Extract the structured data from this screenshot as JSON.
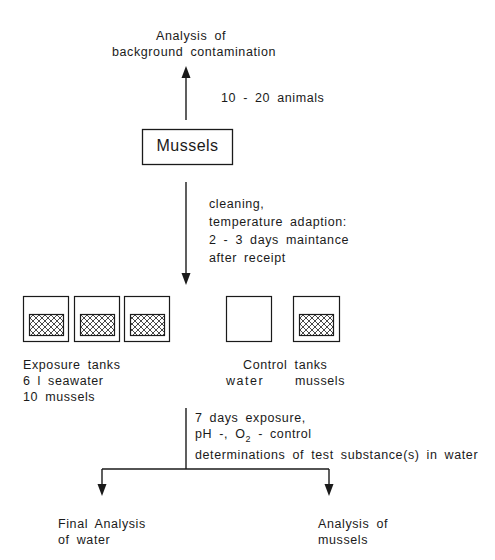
{
  "title_top": {
    "line1": "Analysis of",
    "line2": "background contamination"
  },
  "arrow_up_label": "10 - 20 animals",
  "mussels_box": {
    "label": "Mussels"
  },
  "preparation": {
    "lines": [
      "cleaning,",
      "temperature adaption:",
      "2 - 3 days maintance",
      "after receipt"
    ]
  },
  "exposure_tanks": {
    "count": 3,
    "label_lines": [
      "Exposure tanks",
      "6 l seawater",
      "10 mussels"
    ]
  },
  "control_tanks": {
    "title": "Control tanks",
    "water_label": "water",
    "mussels_label": "mussels"
  },
  "exposure_step": {
    "line1": "7 days exposure,",
    "line2_prefix": "pH -, O",
    "line2_sub": "2",
    "line2_suffix": " - control",
    "line3": "determinations of test substance(s) in water"
  },
  "outcomes": {
    "left": {
      "line1": "Final Analysis",
      "line2": "of water"
    },
    "right": {
      "line1": "Analysis of",
      "line2": "mussels"
    }
  },
  "colors": {
    "line": "#1a1a1a",
    "background": "#ffffff"
  }
}
